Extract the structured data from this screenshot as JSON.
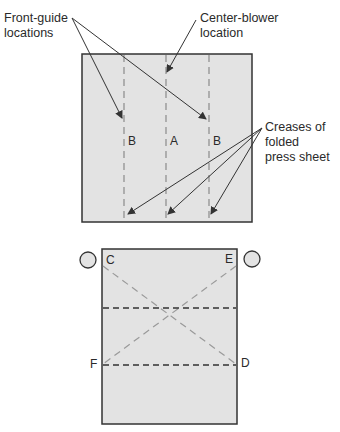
{
  "top_diagram": {
    "callouts": {
      "front_guide": [
        "Front-guide",
        "locations"
      ],
      "center_blower": [
        "Center-blower",
        "location"
      ],
      "creases": [
        "Creases of",
        "folded",
        "press sheet"
      ]
    },
    "column_labels": [
      "B",
      "A",
      "B"
    ]
  },
  "bottom_diagram": {
    "corner_labels": {
      "top_left": "C",
      "top_right": "E",
      "bottom_left": "F",
      "bottom_right": "D"
    }
  },
  "colors": {
    "sheet_fill": "#e3e3e3",
    "border": "#333333",
    "dash_light": "#9a9a9a",
    "dash_dark": "#333333"
  }
}
